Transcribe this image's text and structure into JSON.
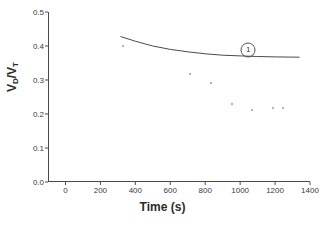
{
  "chart_data": {
    "type": "scatter",
    "title": "",
    "xlabel": "Time (s)",
    "ylabel": "V_D/V_T",
    "ylabel_parts": {
      "lead": "V",
      "sub1": "D",
      "slash": "/V",
      "sub2": "T"
    },
    "xlim": [
      -100,
      1400
    ],
    "ylim": [
      0.0,
      0.5
    ],
    "grid": false,
    "legend": "none",
    "xticks": [
      0,
      200,
      400,
      600,
      800,
      1000,
      1200,
      1400
    ],
    "xtick_labels": [
      "0",
      "200",
      "400",
      "600",
      "800",
      "1000",
      "1200",
      "1400"
    ],
    "yticks": [
      0.0,
      0.1,
      0.2,
      0.3,
      0.4,
      0.5
    ],
    "ytick_labels": [
      "0.0",
      "0.1",
      "0.2",
      "0.3",
      "0.4",
      "0.5"
    ],
    "series": [
      {
        "name": "measured",
        "type": "scatter",
        "marker": "small-dot",
        "color": "#9a9a9a",
        "points": [
          {
            "x": 325,
            "y": 0.4
          },
          {
            "x": 710,
            "y": 0.318
          },
          {
            "x": 825,
            "y": 0.29
          },
          {
            "x": 945,
            "y": 0.228
          },
          {
            "x": 1060,
            "y": 0.211
          },
          {
            "x": 1180,
            "y": 0.219
          },
          {
            "x": 1240,
            "y": 0.219
          }
        ]
      },
      {
        "name": "model curve 1",
        "type": "line",
        "color": "#4a4a4a",
        "points": [
          {
            "x": 315,
            "y": 0.428
          },
          {
            "x": 400,
            "y": 0.414
          },
          {
            "x": 500,
            "y": 0.4
          },
          {
            "x": 600,
            "y": 0.39
          },
          {
            "x": 700,
            "y": 0.383
          },
          {
            "x": 800,
            "y": 0.377
          },
          {
            "x": 900,
            "y": 0.373
          },
          {
            "x": 1000,
            "y": 0.371
          },
          {
            "x": 1100,
            "y": 0.369
          },
          {
            "x": 1200,
            "y": 0.368
          },
          {
            "x": 1340,
            "y": 0.367
          }
        ]
      }
    ],
    "annotations": [
      {
        "label": "1",
        "style": "circled",
        "x": 1040,
        "y": 0.388
      }
    ]
  }
}
